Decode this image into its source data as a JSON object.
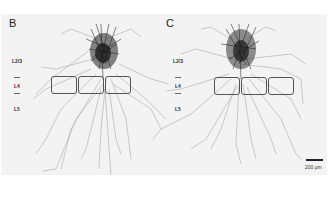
{
  "figure": {
    "background": "#f3f3f3",
    "panels": [
      {
        "letter": "B",
        "layers": [
          {
            "label": "L2/3"
          },
          {
            "label": "L4"
          },
          {
            "label": "L5"
          }
        ],
        "barrel_boxes": 3
      },
      {
        "letter": "C",
        "layers": [
          {
            "label": "L2/3"
          },
          {
            "label": "L4"
          },
          {
            "label": "L5"
          }
        ],
        "barrel_boxes": 3
      }
    ],
    "scale_bar": {
      "label": "200 μm"
    }
  }
}
